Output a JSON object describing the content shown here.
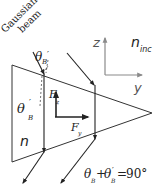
{
  "diagram": {
    "beam_label_line1": "Gaussian",
    "beam_label_line2": "beam",
    "theta_b_top": "θ",
    "theta_b_top_sub": "B",
    "theta_b_top_prime": "′",
    "theta_b_prime_left": "θ",
    "theta_b_prime_left_sub": "B",
    "theta_b_prime_left_prime": "′",
    "force_z": "F",
    "force_z_sub": "z",
    "force_y": "F",
    "force_y_sub": "y",
    "refractive_index_prism": "n",
    "refractive_index_incident": "n",
    "refractive_index_incident_sub": "inc",
    "axis_z": "z",
    "axis_y": "y",
    "equation": {
      "t1": "θ",
      "t1_sub": "B",
      "plus": "+",
      "t2": "θ",
      "t2_sub": "B",
      "t2_prime": "′",
      "equals": "=",
      "value": "90°"
    },
    "colors": {
      "line": "#222222",
      "axis_gray": "#8a8a8a",
      "background": "#ffffff"
    }
  }
}
